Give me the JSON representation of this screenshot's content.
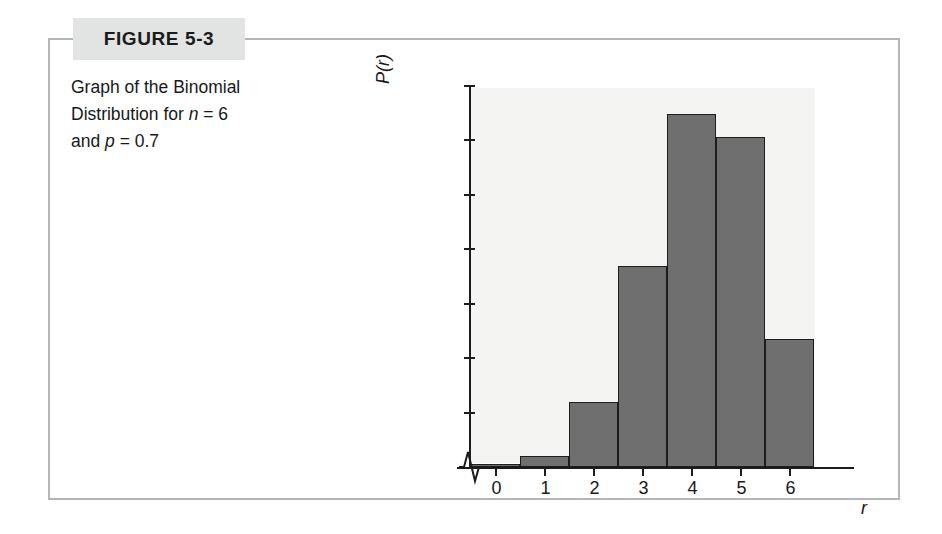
{
  "figure": {
    "number_label": "FIGURE 5-3",
    "caption_line1_a": "Graph of the Binomial",
    "caption_line2_a": "Distribution for ",
    "caption_line2_n": "n",
    "caption_line2_b": " = 6",
    "caption_line3_a": "and ",
    "caption_line3_p": "p",
    "caption_line3_b": " = 0.7"
  },
  "colors": {
    "frame": "#b3b5b8",
    "tab_background": "#e2e3e3",
    "bar_fill": "#6f6f6f",
    "bar_outline": "#1d1d1d",
    "plot_background": "#f4f4f2",
    "axis": "#1c1c1c",
    "text": "#17181a"
  },
  "chart_data": {
    "type": "bar",
    "title": "",
    "xlabel": "r",
    "ylabel": "P(r)",
    "categories": [
      "0",
      "1",
      "2",
      "3",
      "4",
      "5",
      "6"
    ],
    "values": [
      0.001,
      0.01,
      0.06,
      0.185,
      0.324,
      0.303,
      0.118
    ],
    "ytick_labels": [
      "0.05",
      "0.10",
      "0.15",
      "0.20",
      "0.25",
      "0.30",
      "0.35"
    ],
    "ytick_values": [
      0.05,
      0.1,
      0.15,
      0.2,
      0.25,
      0.3,
      0.35
    ],
    "ylim": [
      0,
      0.35
    ],
    "xlim": [
      -0.5,
      6.5
    ],
    "grid": false,
    "legend": "none",
    "axis_break": "x-axis break near origin",
    "annotations": []
  }
}
